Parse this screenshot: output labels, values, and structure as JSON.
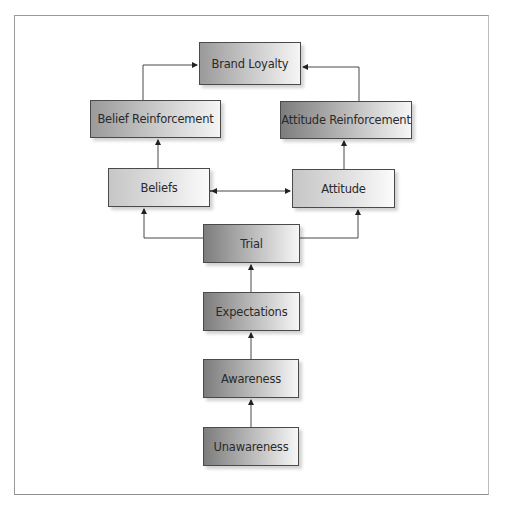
{
  "diagram": {
    "type": "flowchart",
    "nodes": {
      "brand_loyalty": "Brand Loyalty",
      "belief_reinforcement": "Belief Reinforcement",
      "attitude_reinforcement": "Attitude Reinforcement",
      "beliefs": "Beliefs",
      "attitude": "Attitude",
      "trial": "Trial",
      "expectations": "Expectations",
      "awareness": "Awareness",
      "unawareness": "Unawareness"
    },
    "edges": [
      {
        "from": "Unawareness",
        "to": "Awareness"
      },
      {
        "from": "Awareness",
        "to": "Expectations"
      },
      {
        "from": "Expectations",
        "to": "Trial"
      },
      {
        "from": "Trial",
        "to": "Beliefs"
      },
      {
        "from": "Trial",
        "to": "Attitude"
      },
      {
        "from": "Beliefs",
        "to": "Attitude",
        "bidirectional": true
      },
      {
        "from": "Beliefs",
        "to": "Belief Reinforcement"
      },
      {
        "from": "Attitude",
        "to": "Attitude Reinforcement"
      },
      {
        "from": "Belief Reinforcement",
        "to": "Brand Loyalty"
      },
      {
        "from": "Attitude Reinforcement",
        "to": "Brand Loyalty"
      }
    ]
  }
}
